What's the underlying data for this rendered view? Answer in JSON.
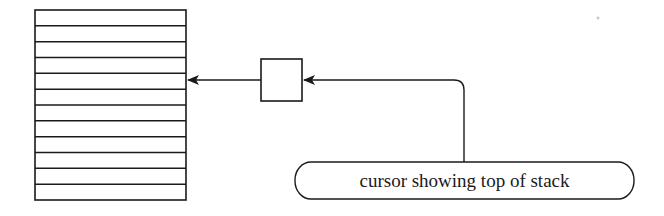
{
  "diagram": {
    "title": "",
    "stack": {
      "rows": 12,
      "x": 35,
      "y": 10,
      "width": 151,
      "height": 190,
      "top_marker_row": 4
    },
    "cursor_box": {
      "x": 261,
      "y": 59,
      "width": 41,
      "height": 42
    },
    "label": {
      "text": "cursor showing top of stack",
      "x": 295,
      "y": 162,
      "width": 339,
      "height": 37
    },
    "arrows": [
      {
        "from": "cursor_box",
        "to": "stack",
        "y": 80
      },
      {
        "from": "label",
        "to": "cursor_box",
        "y": 80
      }
    ],
    "colors": {
      "line": "#1a1a1a",
      "background": "#ffffff"
    }
  }
}
